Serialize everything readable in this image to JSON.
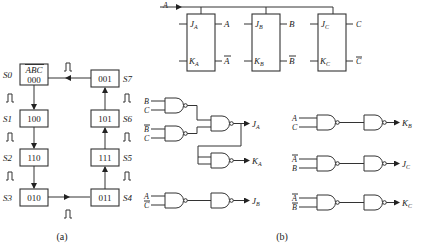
{
  "part_a": {
    "caption": "(a)",
    "header_label": "ABC",
    "states": [
      {
        "name": "S0",
        "code": "000"
      },
      {
        "name": "S1",
        "code": "100"
      },
      {
        "name": "S2",
        "code": "110"
      },
      {
        "name": "S3",
        "code": "010"
      },
      {
        "name": "S4",
        "code": "011"
      },
      {
        "name": "S5",
        "code": "111"
      },
      {
        "name": "S6",
        "code": "101"
      },
      {
        "name": "S7",
        "code": "001"
      }
    ],
    "pulse_symbol": "⎍"
  },
  "part_b": {
    "caption": "(b)",
    "clock_input": "A",
    "flipflops": [
      {
        "j": "J",
        "j_sub": "A",
        "k": "K",
        "k_sub": "A",
        "q": "A",
        "qbar": "A"
      },
      {
        "j": "J",
        "j_sub": "B",
        "k": "K",
        "k_sub": "B",
        "q": "B",
        "qbar": "B"
      },
      {
        "j": "J",
        "j_sub": "C",
        "k": "K",
        "k_sub": "C",
        "q": "C",
        "qbar": "C"
      }
    ],
    "gates_left": [
      {
        "in1": "B",
        "in1_bar": false,
        "in2": "C",
        "in2_bar": false
      },
      {
        "in1": "B",
        "in1_bar": true,
        "in2": "C",
        "in2_bar": false
      },
      {
        "in1": "A",
        "in1_bar": false,
        "in2": "C",
        "in2_bar": true
      }
    ],
    "outputs_left": [
      {
        "label": "J",
        "sub": "A"
      },
      {
        "label": "K",
        "sub": "A"
      },
      {
        "label": "J",
        "sub": "B"
      }
    ],
    "gates_right": [
      {
        "in1": "A",
        "in1_bar": false,
        "in2": "C",
        "in2_bar": false,
        "out": "K",
        "out_sub": "B"
      },
      {
        "in1": "A",
        "in1_bar": true,
        "in2": "B",
        "in2_bar": false,
        "out": "J",
        "out_sub": "C"
      },
      {
        "in1": "A",
        "in1_bar": true,
        "in2": "B",
        "in2_bar": true,
        "out": "K",
        "out_sub": "C"
      }
    ]
  }
}
